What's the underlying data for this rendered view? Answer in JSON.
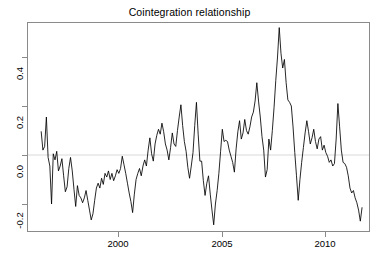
{
  "chart_data": {
    "type": "line",
    "title": "Cointegration relationship",
    "xlabel": "",
    "ylabel": "",
    "xlim": [
      1996.25,
      1911.6
    ],
    "ylim": [
      -0.3,
      0.53
    ],
    "grid": false,
    "legend": null,
    "legend_position": "none",
    "series_color": "#000000",
    "reference_line": {
      "y": 0.0,
      "color": "#d9d9d9"
    },
    "xticks": [
      2000,
      2005,
      2010
    ],
    "xtick_labels": [
      "2000",
      "2005",
      "2010"
    ],
    "yticks": [
      -0.2,
      0.0,
      0.2,
      0.4
    ],
    "ytick_labels": [
      "-0.2",
      "0.0",
      "0.2",
      "0.4"
    ],
    "series": [
      {
        "name": "cointegration residual",
        "x_start": 1996.29,
        "x_step": 0.08333,
        "values": [
          0.095,
          0.02,
          0.035,
          0.155,
          -0.01,
          -0.045,
          -0.2,
          0.005,
          -0.02,
          0.015,
          -0.065,
          -0.045,
          -0.015,
          -0.085,
          -0.15,
          -0.13,
          -0.055,
          -0.01,
          -0.065,
          -0.14,
          -0.21,
          -0.125,
          -0.165,
          -0.175,
          -0.195,
          -0.175,
          -0.145,
          -0.185,
          -0.225,
          -0.265,
          -0.24,
          -0.185,
          -0.135,
          -0.115,
          -0.135,
          -0.095,
          -0.12,
          -0.075,
          -0.09,
          -0.065,
          -0.1,
          -0.075,
          -0.105,
          -0.085,
          -0.06,
          -0.075,
          -0.055,
          -0.005,
          -0.04,
          -0.075,
          -0.115,
          -0.155,
          -0.19,
          -0.235,
          -0.16,
          -0.1,
          -0.075,
          -0.055,
          -0.085,
          -0.045,
          -0.02,
          -0.045,
          0.02,
          0.07,
          0.005,
          -0.025,
          0.045,
          0.08,
          0.105,
          0.085,
          0.13,
          0.095,
          0.045,
          0.02,
          -0.02,
          0.03,
          0.09,
          0.045,
          0.035,
          0.1,
          0.155,
          0.205,
          0.12,
          0.055,
          0.015,
          -0.05,
          -0.095,
          -0.045,
          0.01,
          0.12,
          0.215,
          0.085,
          -0.025,
          -0.025,
          -0.105,
          -0.165,
          -0.115,
          -0.085,
          -0.16,
          -0.225,
          -0.285,
          -0.2,
          -0.145,
          -0.075,
          0.015,
          0.105,
          0.055,
          0.06,
          0.055,
          0.02,
          -0.005,
          -0.03,
          -0.07,
          0.025,
          0.095,
          0.14,
          0.065,
          0.09,
          0.145,
          0.1,
          0.085,
          0.115,
          0.155,
          0.175,
          0.22,
          0.295,
          0.22,
          0.155,
          0.075,
          0.02,
          -0.09,
          -0.06,
          0.065,
          0.02,
          0.1,
          0.195,
          0.305,
          0.4,
          0.52,
          0.415,
          0.355,
          0.39,
          0.295,
          0.225,
          0.215,
          0.2,
          0.115,
          0.01,
          -0.085,
          -0.185,
          -0.1,
          -0.03,
          0.03,
          0.09,
          0.14,
          0.095,
          0.045,
          0.07,
          0.105,
          0.055,
          0.025,
          0.065,
          0.075,
          0.02,
          0.04,
          0.01,
          -0.005,
          -0.03,
          -0.02,
          -0.045,
          -0.035,
          0.065,
          0.21,
          0.115,
          0.02,
          -0.03,
          -0.035,
          -0.05,
          -0.085,
          -0.135,
          -0.155,
          -0.145,
          -0.175,
          -0.195,
          -0.225,
          -0.27,
          -0.215
        ]
      }
    ]
  },
  "axes": {
    "y_labels": [
      "0.4",
      "0.2",
      "0.0",
      "-0.2"
    ],
    "x_labels": [
      "2000",
      "2005",
      "2010"
    ]
  }
}
